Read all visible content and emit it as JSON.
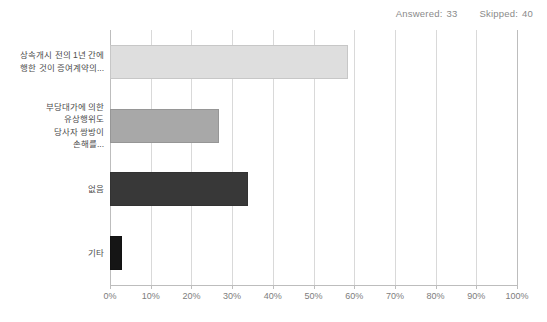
{
  "header": {
    "answered_label": "Answered:",
    "answered_value": "33",
    "skipped_label": "Skipped:",
    "skipped_value": "40"
  },
  "colors": {
    "bar_1": "#dedede",
    "bar_2": "#a8a8a8",
    "bar_3": "#383838",
    "bar_4": "#151515",
    "gridline": "#d9d9d9",
    "axis": "#bdbdbd",
    "label_text": "#4d4d4d",
    "tick_text": "#7d7d7d",
    "header_text": "#8a8a8a"
  },
  "chart_data": {
    "type": "bar",
    "orientation": "horizontal",
    "title": "",
    "xlabel": "",
    "ylabel": "",
    "xlim": [
      0,
      100
    ],
    "grid": true,
    "legend": false,
    "categories": [
      "상속개시 전의 1년 간에\n행한 것이 증여계약의...",
      "부당대가에 의한\n유상행위도\n당사자 쌍방이\n손해를...",
      "없음",
      "기타"
    ],
    "values": [
      58.5,
      26.8,
      33.9,
      3.0
    ],
    "tick_labels": [
      "0%",
      "10%",
      "20%",
      "30%",
      "40%",
      "50%",
      "60%",
      "70%",
      "80%",
      "90%",
      "100%"
    ],
    "tick_values": [
      0,
      10,
      20,
      30,
      40,
      50,
      60,
      70,
      80,
      90,
      100
    ]
  }
}
